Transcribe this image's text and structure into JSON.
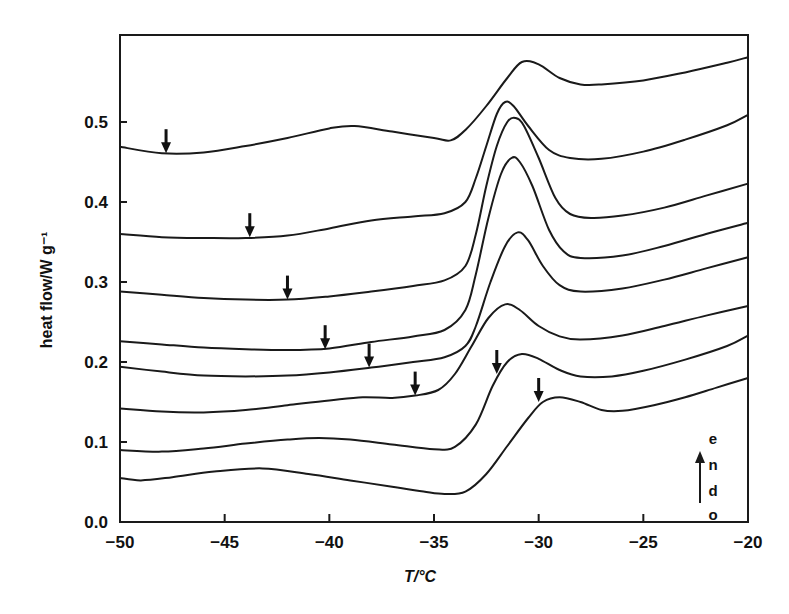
{
  "chart_data": {
    "type": "line",
    "title": "",
    "xlabel": "T/°C",
    "ylabel": "heat flow/W g⁻¹",
    "xlim": [
      -50,
      -20
    ],
    "ylim": [
      0.0,
      0.6
    ],
    "grid": false,
    "legend": "none",
    "x_ticks": [
      -50,
      -45,
      -40,
      -35,
      -30,
      -25,
      -20
    ],
    "x_tick_labels": [
      "−50",
      "−45",
      "−40",
      "−35",
      "−30",
      "−25",
      "−20"
    ],
    "y_ticks": [
      0.0,
      0.1,
      0.2,
      0.3,
      0.4,
      0.5
    ],
    "y_tick_labels": [
      "0.0",
      "0.1",
      "0.2",
      "0.3",
      "0.4",
      "0.5"
    ],
    "annotation": {
      "text": "endo",
      "letters": [
        "e",
        "n",
        "d",
        "o"
      ],
      "arrow": "up",
      "position": "bottom-right"
    },
    "series": [
      {
        "name": "curve 1",
        "arrow_at": [
          -47.8,
          0.461
        ],
        "points": [
          [
            -50,
            0.469
          ],
          [
            -48,
            0.461
          ],
          [
            -46,
            0.462
          ],
          [
            -44,
            0.47
          ],
          [
            -42,
            0.48
          ],
          [
            -40,
            0.492
          ],
          [
            -38.8,
            0.495
          ],
          [
            -37,
            0.488
          ],
          [
            -35,
            0.48
          ],
          [
            -34.2,
            0.477
          ],
          [
            -33.5,
            0.49
          ],
          [
            -32.5,
            0.52
          ],
          [
            -31.5,
            0.555
          ],
          [
            -30.8,
            0.575
          ],
          [
            -30,
            0.572
          ],
          [
            -29,
            0.555
          ],
          [
            -28,
            0.547
          ],
          [
            -27,
            0.547
          ],
          [
            -25,
            0.552
          ],
          [
            -23,
            0.562
          ],
          [
            -21,
            0.574
          ],
          [
            -20,
            0.581
          ]
        ]
      },
      {
        "name": "curve 2",
        "arrow_at": [
          -43.8,
          0.356
        ],
        "points": [
          [
            -50,
            0.36
          ],
          [
            -48,
            0.356
          ],
          [
            -46,
            0.355
          ],
          [
            -44,
            0.355
          ],
          [
            -42,
            0.358
          ],
          [
            -40,
            0.367
          ],
          [
            -38,
            0.377
          ],
          [
            -36,
            0.382
          ],
          [
            -34.5,
            0.386
          ],
          [
            -33.5,
            0.4
          ],
          [
            -33,
            0.43
          ],
          [
            -32.5,
            0.47
          ],
          [
            -32,
            0.51
          ],
          [
            -31.6,
            0.525
          ],
          [
            -31.2,
            0.52
          ],
          [
            -30.5,
            0.495
          ],
          [
            -29.5,
            0.465
          ],
          [
            -28.5,
            0.455
          ],
          [
            -27,
            0.454
          ],
          [
            -25,
            0.463
          ],
          [
            -23,
            0.478
          ],
          [
            -21,
            0.496
          ],
          [
            -20,
            0.509
          ]
        ]
      },
      {
        "name": "curve 3",
        "arrow_at": [
          -42.0,
          0.278
        ],
        "points": [
          [
            -50,
            0.288
          ],
          [
            -48,
            0.284
          ],
          [
            -46,
            0.28
          ],
          [
            -44,
            0.278
          ],
          [
            -42,
            0.278
          ],
          [
            -40,
            0.282
          ],
          [
            -38,
            0.288
          ],
          [
            -36,
            0.295
          ],
          [
            -34.5,
            0.302
          ],
          [
            -33.5,
            0.32
          ],
          [
            -33,
            0.36
          ],
          [
            -32.5,
            0.42
          ],
          [
            -32,
            0.47
          ],
          [
            -31.5,
            0.5
          ],
          [
            -31.1,
            0.505
          ],
          [
            -30.7,
            0.495
          ],
          [
            -30,
            0.455
          ],
          [
            -29.2,
            0.405
          ],
          [
            -28.5,
            0.385
          ],
          [
            -27.5,
            0.38
          ],
          [
            -26,
            0.383
          ],
          [
            -24,
            0.393
          ],
          [
            -22,
            0.408
          ],
          [
            -20,
            0.423
          ]
        ]
      },
      {
        "name": "curve 4",
        "arrow_at": [
          -40.2,
          0.216
        ],
        "points": [
          [
            -50,
            0.226
          ],
          [
            -48,
            0.222
          ],
          [
            -46,
            0.218
          ],
          [
            -44,
            0.216
          ],
          [
            -42,
            0.215
          ],
          [
            -40,
            0.217
          ],
          [
            -38,
            0.225
          ],
          [
            -36,
            0.232
          ],
          [
            -34.5,
            0.24
          ],
          [
            -33.5,
            0.265
          ],
          [
            -33,
            0.31
          ],
          [
            -32.4,
            0.38
          ],
          [
            -31.8,
            0.435
          ],
          [
            -31.3,
            0.455
          ],
          [
            -30.9,
            0.45
          ],
          [
            -30.3,
            0.42
          ],
          [
            -29.5,
            0.365
          ],
          [
            -28.8,
            0.338
          ],
          [
            -28,
            0.33
          ],
          [
            -26,
            0.333
          ],
          [
            -24,
            0.345
          ],
          [
            -22,
            0.36
          ],
          [
            -20,
            0.374
          ]
        ]
      },
      {
        "name": "curve 5",
        "arrow_at": [
          -38.1,
          0.193
        ],
        "points": [
          [
            -50,
            0.194
          ],
          [
            -48,
            0.188
          ],
          [
            -46,
            0.183
          ],
          [
            -44,
            0.182
          ],
          [
            -42,
            0.183
          ],
          [
            -40,
            0.187
          ],
          [
            -38,
            0.193
          ],
          [
            -36,
            0.2
          ],
          [
            -34.5,
            0.206
          ],
          [
            -33.5,
            0.22
          ],
          [
            -33,
            0.245
          ],
          [
            -32.3,
            0.3
          ],
          [
            -31.6,
            0.345
          ],
          [
            -31,
            0.362
          ],
          [
            -30.5,
            0.352
          ],
          [
            -29.8,
            0.32
          ],
          [
            -29,
            0.296
          ],
          [
            -28,
            0.288
          ],
          [
            -26,
            0.292
          ],
          [
            -24,
            0.303
          ],
          [
            -22,
            0.317
          ],
          [
            -20,
            0.331
          ]
        ]
      },
      {
        "name": "curve 6",
        "arrow_at": [
          -35.9,
          0.158
        ],
        "points": [
          [
            -50,
            0.142
          ],
          [
            -48,
            0.138
          ],
          [
            -46,
            0.137
          ],
          [
            -44,
            0.14
          ],
          [
            -42,
            0.146
          ],
          [
            -40,
            0.152
          ],
          [
            -38.4,
            0.156
          ],
          [
            -37,
            0.155
          ],
          [
            -35.9,
            0.158
          ],
          [
            -34.8,
            0.165
          ],
          [
            -34,
            0.185
          ],
          [
            -33.2,
            0.22
          ],
          [
            -32.4,
            0.255
          ],
          [
            -31.6,
            0.272
          ],
          [
            -30.9,
            0.265
          ],
          [
            -30,
            0.245
          ],
          [
            -29,
            0.232
          ],
          [
            -28,
            0.228
          ],
          [
            -26,
            0.233
          ],
          [
            -24,
            0.245
          ],
          [
            -22,
            0.258
          ],
          [
            -20,
            0.27
          ]
        ]
      },
      {
        "name": "curve 7",
        "arrow_at": [
          -32.0,
          0.185
        ],
        "points": [
          [
            -50,
            0.09
          ],
          [
            -48,
            0.088
          ],
          [
            -46,
            0.092
          ],
          [
            -44,
            0.098
          ],
          [
            -42,
            0.103
          ],
          [
            -40.5,
            0.105
          ],
          [
            -39,
            0.103
          ],
          [
            -37,
            0.097
          ],
          [
            -35,
            0.091
          ],
          [
            -34,
            0.094
          ],
          [
            -33,
            0.122
          ],
          [
            -32.2,
            0.17
          ],
          [
            -31.5,
            0.2
          ],
          [
            -30.8,
            0.21
          ],
          [
            -30,
            0.204
          ],
          [
            -29,
            0.19
          ],
          [
            -28,
            0.182
          ],
          [
            -26.5,
            0.182
          ],
          [
            -25,
            0.189
          ],
          [
            -23,
            0.203
          ],
          [
            -21,
            0.22
          ],
          [
            -20,
            0.233
          ]
        ]
      },
      {
        "name": "curve 8",
        "arrow_at": [
          -30.0,
          0.15
        ],
        "points": [
          [
            -50,
            0.055
          ],
          [
            -49,
            0.052
          ],
          [
            -47.5,
            0.056
          ],
          [
            -45.5,
            0.063
          ],
          [
            -43.2,
            0.067
          ],
          [
            -41,
            0.06
          ],
          [
            -39,
            0.052
          ],
          [
            -37,
            0.044
          ],
          [
            -35.5,
            0.038
          ],
          [
            -34.5,
            0.035
          ],
          [
            -33.5,
            0.038
          ],
          [
            -32.5,
            0.06
          ],
          [
            -31.5,
            0.095
          ],
          [
            -30.5,
            0.13
          ],
          [
            -29.8,
            0.15
          ],
          [
            -29,
            0.156
          ],
          [
            -28,
            0.15
          ],
          [
            -27,
            0.14
          ],
          [
            -26,
            0.139
          ],
          [
            -24.5,
            0.146
          ],
          [
            -23,
            0.156
          ],
          [
            -21.5,
            0.168
          ],
          [
            -20,
            0.18
          ]
        ]
      }
    ]
  }
}
